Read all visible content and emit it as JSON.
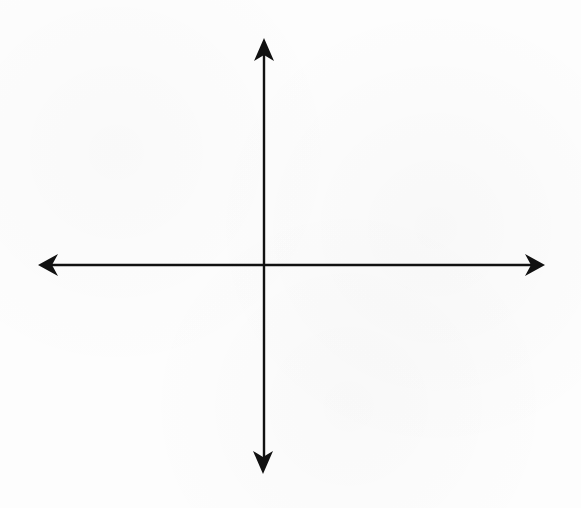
{
  "diagram": {
    "type": "coordinate-axes",
    "stroke_color": "#111111",
    "background_color": "#fdfdfd",
    "origin": {
      "x": 264,
      "y": 265
    },
    "horizontal_axis": {
      "x1": 46,
      "x2": 537,
      "y": 265,
      "arrow_left_tip": {
        "x": 38,
        "y": 265
      },
      "arrow_right_tip": {
        "x": 545,
        "y": 265
      }
    },
    "vertical_axis": {
      "x": 264,
      "y1": 46,
      "y2": 466,
      "arrow_top_tip": {
        "x": 264,
        "y": 38
      },
      "arrow_bottom_tip": {
        "x": 263,
        "y": 474
      }
    },
    "labels": []
  }
}
